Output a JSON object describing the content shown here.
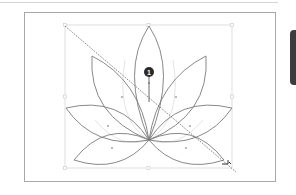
{
  "canvas": {
    "artwork_name": "lotus",
    "stroke_color": "#7a7a7a",
    "guide_color": "#d0d0d0",
    "selection_box_color": "#cfcfcf",
    "transform_line_color": "#555555"
  },
  "callout": {
    "number": "1",
    "fill": "#2a2a2a"
  },
  "side_panel": {
    "tab_color": "#3c3c3c"
  }
}
